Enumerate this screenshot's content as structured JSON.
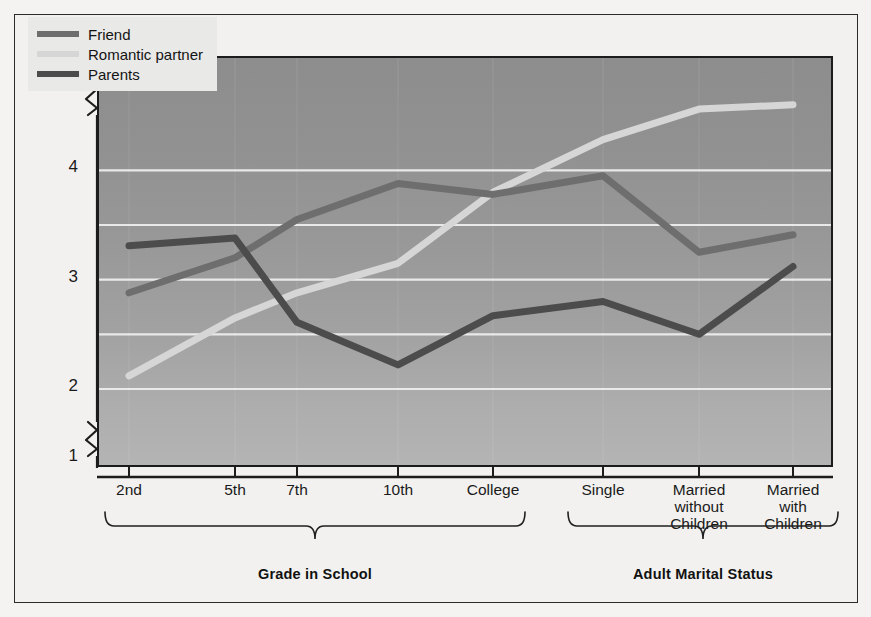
{
  "chart_data": {
    "type": "line",
    "title": "",
    "xlabel": "",
    "ylabel": "Mean Self-Disclosure Score",
    "ylim": [
      1,
      5
    ],
    "yticks": [
      1,
      2,
      3,
      4,
      5
    ],
    "y_axis_break": true,
    "grid": true,
    "gridlines": [
      2,
      2.5,
      3,
      3.5,
      4
    ],
    "legend_position": "top-left",
    "categories": [
      "2nd",
      "5th",
      "7th",
      "10th",
      "College",
      "Single",
      "Married without Children",
      "Married with Children"
    ],
    "series": [
      {
        "name": "Friend",
        "color": "#6e6e6e",
        "values": [
          2.88,
          3.2,
          3.55,
          3.88,
          3.78,
          3.95,
          3.25,
          3.41
        ]
      },
      {
        "name": "Romantic partner",
        "color": "#d6d6d6",
        "values": [
          2.12,
          2.65,
          2.88,
          3.15,
          3.8,
          4.28,
          4.56,
          4.6
        ]
      },
      {
        "name": "Parents",
        "color": "#4c4c4c",
        "values": [
          3.31,
          3.38,
          2.61,
          2.22,
          2.67,
          2.8,
          2.5,
          3.12
        ]
      }
    ],
    "group_brackets": [
      {
        "label": "Grade in School",
        "categories": [
          "2nd",
          "5th",
          "7th",
          "10th",
          "College"
        ]
      },
      {
        "label": "Adult Marital Status",
        "categories": [
          "Single",
          "Married without Children",
          "Married with Children"
        ]
      }
    ]
  },
  "axis": {
    "y_title": "Mean Self-Disclosure Score",
    "y_ticks": [
      "5",
      "4",
      "3",
      "2",
      "1"
    ],
    "x_ticks": [
      {
        "lines": [
          "2nd"
        ]
      },
      {
        "lines": [
          "5th"
        ]
      },
      {
        "lines": [
          "7th"
        ]
      },
      {
        "lines": [
          "10th"
        ]
      },
      {
        "lines": [
          "College"
        ]
      },
      {
        "lines": [
          "Single"
        ]
      },
      {
        "lines": [
          "Married",
          "without",
          "Children"
        ]
      },
      {
        "lines": [
          "Married",
          "with",
          "Children"
        ]
      }
    ]
  },
  "legend": {
    "items": [
      {
        "label": "Friend",
        "color": "#6e6e6e"
      },
      {
        "label": "Romantic partner",
        "color": "#d6d6d6"
      },
      {
        "label": "Parents",
        "color": "#4c4c4c"
      }
    ]
  },
  "groups": [
    {
      "label": "Grade in School"
    },
    {
      "label": "Adult Marital Status"
    }
  ]
}
